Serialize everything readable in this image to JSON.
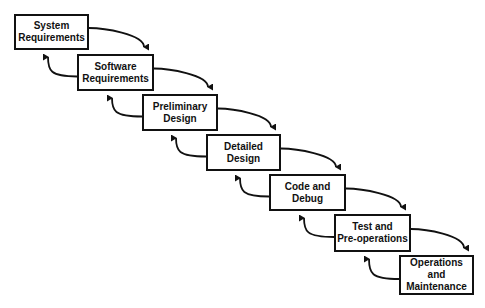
{
  "diagram": {
    "type": "waterfall",
    "stages": [
      {
        "id": "s1",
        "label": "System\nRequirements",
        "x": 14,
        "y": 14,
        "w": 75,
        "h": 36
      },
      {
        "id": "s2",
        "label": "Software\nRequirements",
        "x": 77,
        "y": 54,
        "w": 77,
        "h": 37
      },
      {
        "id": "s3",
        "label": "Preliminary\nDesign",
        "x": 142,
        "y": 94,
        "w": 76,
        "h": 37
      },
      {
        "id": "s4",
        "label": "Detailed\nDesign",
        "x": 206,
        "y": 134,
        "w": 75,
        "h": 37
      },
      {
        "id": "s5",
        "label": "Code and\nDebug",
        "x": 269,
        "y": 174,
        "w": 77,
        "h": 37
      },
      {
        "id": "s6",
        "label": "Test and\nPre-operations",
        "x": 334,
        "y": 214,
        "w": 77,
        "h": 38
      },
      {
        "id": "s7",
        "label": "Operations\nand\nMaintenance",
        "x": 399,
        "y": 255,
        "w": 75,
        "h": 40
      }
    ],
    "edges": {
      "forward": "each stage to next (downward curved arrow)",
      "feedback": "each stage back to previous (upward curved arrow)"
    }
  }
}
